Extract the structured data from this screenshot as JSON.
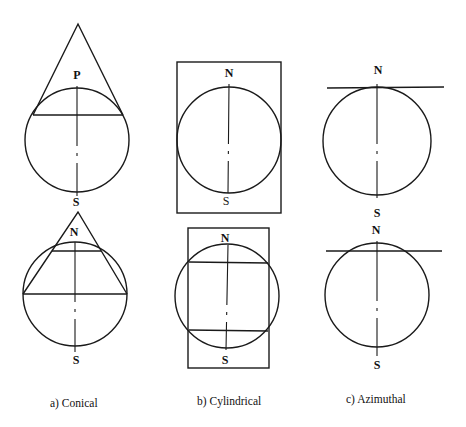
{
  "figure": {
    "panels": [
      {
        "id": "conical",
        "caption": "a) Conical",
        "top": {
          "top_label": "P",
          "bottom_label": "S",
          "description": "Cone tangent to globe along one standard parallel"
        },
        "bottom": {
          "apex_label": "S",
          "top_label": "N",
          "bottom_label": "S",
          "description": "Secant cone intersecting globe along two standard parallels"
        }
      },
      {
        "id": "cylindrical",
        "caption": "b) Cylindrical",
        "top": {
          "top_label": "N",
          "bottom_label": "S",
          "description": "Cylinder tangent to globe along equator"
        },
        "bottom": {
          "top_label": "N",
          "bottom_label": "S",
          "description": "Secant cylinder intersecting globe along two parallels"
        }
      },
      {
        "id": "azimuthal",
        "caption": "c) Azimuthal",
        "top": {
          "top_label": "N",
          "bottom_label": "S",
          "description": "Plane tangent to globe at pole"
        },
        "bottom": {
          "top_label": "N",
          "bottom_label": "S",
          "description": "Secant plane intersecting globe"
        }
      }
    ]
  }
}
